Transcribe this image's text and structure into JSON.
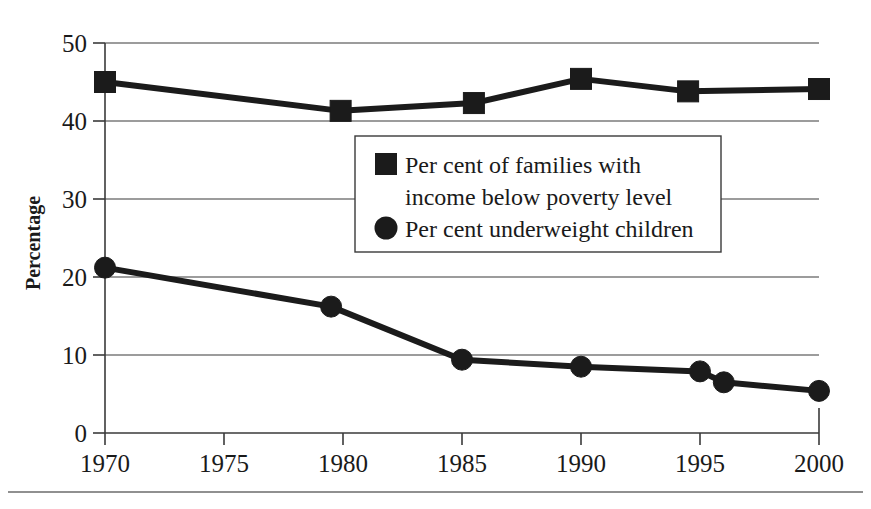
{
  "chart_data": {
    "type": "line",
    "title": "",
    "xlabel": "",
    "ylabel": "Percentage",
    "xlim": [
      1968.0,
      1901.5
    ],
    "ylim": [
      0,
      50
    ],
    "grid": true,
    "legend_position": "center",
    "x_ticks": [
      "1970",
      "1975",
      "1980",
      "1985",
      "1990",
      "1995",
      "2000"
    ],
    "x_tick_values": [
      1970,
      1975,
      1980,
      1985,
      1990,
      1995,
      2000
    ],
    "y_ticks": [
      "0",
      "10",
      "20",
      "30",
      "40",
      "50"
    ],
    "y_tick_values": [
      0,
      10,
      20,
      30,
      40,
      50
    ],
    "series": [
      {
        "name": "Per cent of families with income below poverty level",
        "marker": "square",
        "x": [
          1970,
          1979.9,
          1985.5,
          1990,
          1994.5,
          2000
        ],
        "values": [
          45.0,
          41.3,
          42.3,
          45.4,
          43.8,
          44.1
        ]
      },
      {
        "name": "Per cent underweight children",
        "marker": "circle",
        "x": [
          1970,
          1979.5,
          1985,
          1990,
          1995,
          1996,
          2000
        ],
        "values": [
          21.2,
          16.2,
          9.4,
          8.5,
          7.9,
          6.5,
          5.4
        ]
      }
    ]
  },
  "axis": {
    "y_title": "Percentage"
  },
  "legend": {
    "entries": [
      {
        "marker": "square",
        "line1": "Per cent of families with",
        "line2": "income below poverty level"
      },
      {
        "marker": "circle",
        "line1": "Per cent underweight children",
        "line2": ""
      }
    ]
  },
  "colors": {
    "series": "#1b1b1b",
    "axis": "#3a3a3a",
    "grid": "#3a3a3a",
    "background": "#ffffff",
    "footer_rule": "#6b6b6b"
  },
  "icons": {
    "square_marker": "square-marker-icon",
    "circle_marker": "circle-marker-icon"
  }
}
